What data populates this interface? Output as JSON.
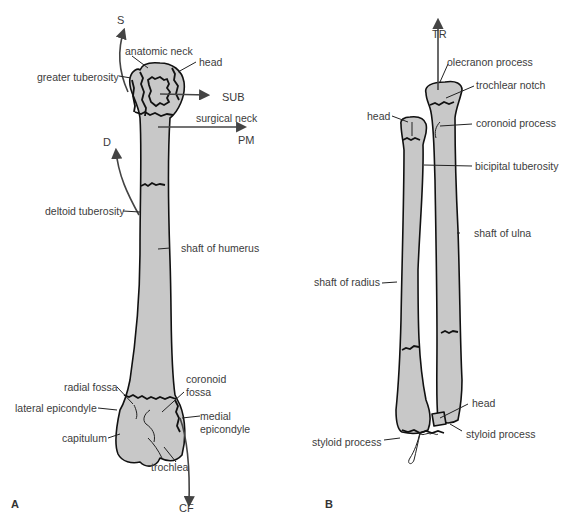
{
  "figure": {
    "panel_a": {
      "letter": "A",
      "bone": "humerus",
      "labels": {
        "anatomic_neck": "anatomic neck",
        "head": "head",
        "greater_tuberosity": "greater tuberosity",
        "surgical_neck": "surgical neck",
        "deltoid_tuberosity": "deltoid tuberosity",
        "shaft_of_humerus": "shaft of humerus",
        "radial_fossa": "radial fossa",
        "coronoid_fossa_1": "coronoid",
        "coronoid_fossa_2": "fossa",
        "lateral_epicondyle": "lateral epicondyle",
        "medial_epicondyle_1": "medial",
        "medial_epicondyle_2": "epicondyle",
        "capitulum": "capitulum",
        "trochlea": "trochlea"
      },
      "arrows": {
        "s": "S",
        "sub": "SUB",
        "pm": "PM",
        "d": "D",
        "cf": "CF"
      }
    },
    "panel_b": {
      "letter": "B",
      "bones": [
        "radius",
        "ulna"
      ],
      "labels": {
        "olecranon_process": "olecranon process",
        "trochlear_notch": "trochlear notch",
        "head_radius": "head",
        "coronoid_process": "coronoid process",
        "bicipital_tuberosity": "bicipital tuberosity",
        "shaft_of_ulna": "shaft of ulna",
        "shaft_of_radius": "shaft of radius",
        "head_ulna": "head",
        "styloid_process_radius": "styloid process",
        "styloid_process_ulna": "styloid process"
      },
      "arrows": {
        "tr": "TR"
      }
    },
    "colors": {
      "bone_fill": "#c8c8c8",
      "outline": "#111111",
      "arrow": "#444444",
      "text": "#3c3c3c"
    }
  }
}
